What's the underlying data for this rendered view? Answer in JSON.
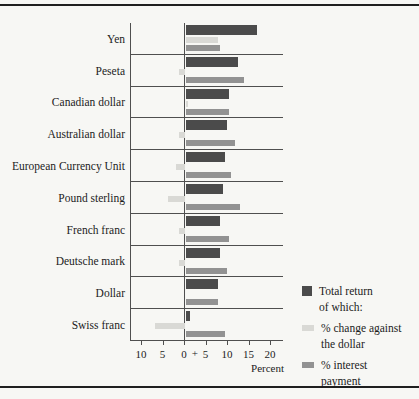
{
  "figure": {
    "background": "#f7f7f4",
    "frame_color": "#1f1f1f"
  },
  "chart_data": {
    "type": "bar",
    "orientation": "horizontal",
    "title": "",
    "xlabel": "Percent",
    "categories": [
      "Yen",
      "Peseta",
      "Canadian dollar",
      "Australian dollar",
      "European Currency Unit",
      "Pound sterling",
      "French franc",
      "Deutsche mark",
      "Dollar",
      "Swiss franc"
    ],
    "series": [
      {
        "name": "Total return of which:",
        "color": "#4b4b4b",
        "values": [
          16.5,
          12,
          10,
          9.5,
          9,
          8.5,
          8,
          8,
          7.5,
          1
        ]
      },
      {
        "name": "% change against the dollar",
        "color": "#d9d9d5",
        "values": [
          7.5,
          -1.5,
          0.5,
          -1.5,
          -2,
          -4,
          -1.5,
          -1.5,
          0,
          -7
        ]
      },
      {
        "name": "% interest payment",
        "color": "#929292",
        "values": [
          8,
          13.5,
          10,
          11.5,
          10.5,
          12.5,
          10,
          9.5,
          7.5,
          9
        ]
      }
    ],
    "axis": {
      "min": -12.5,
      "max": 23,
      "ticks": [
        -10,
        -5,
        0,
        5,
        10,
        15,
        20
      ],
      "tick_labels": [
        "10",
        "5",
        "0",
        "5",
        "10",
        "15",
        "20"
      ],
      "plus_label": "+",
      "grid": false,
      "legend_position": "right"
    }
  },
  "legend": {
    "items": [
      {
        "line1": "Total return",
        "line2": "of which:"
      },
      {
        "line1": "% change against",
        "line2": "the dollar"
      },
      {
        "line1": "% interest",
        "line2": "payment"
      }
    ]
  }
}
